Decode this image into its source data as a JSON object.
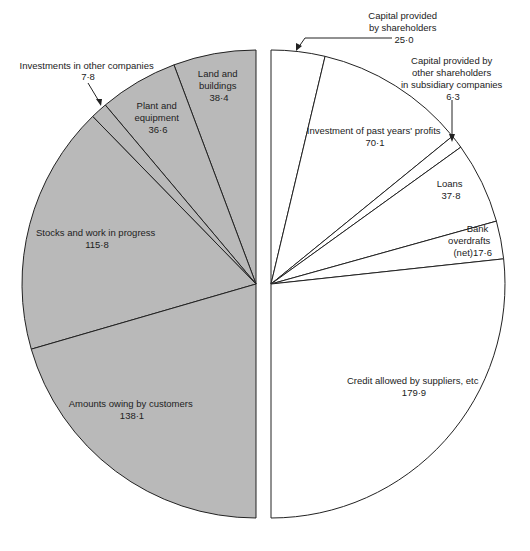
{
  "chart_data": {
    "type": "pie",
    "title": "",
    "layout": "split half-pies: assets (left, shaded) vs sources of funds (right, white)",
    "series": [
      {
        "name": "Assets",
        "side": "left",
        "fill": "#b9b9b9",
        "slices": [
          {
            "label": "Land and buildings",
            "value": 38.4,
            "display": "38·4"
          },
          {
            "label": "Plant and equipment",
            "value": 36.6,
            "display": "36·6"
          },
          {
            "label": "Investments in other companies",
            "value": 7.8,
            "display": "7·8"
          },
          {
            "label": "Stocks and work in progress",
            "value": 115.8,
            "display": "115·8"
          },
          {
            "label": "Amounts owing by customers",
            "value": 138.1,
            "display": "138·1"
          }
        ]
      },
      {
        "name": "Sources of funds",
        "side": "right",
        "fill": "#ffffff",
        "slices": [
          {
            "label": "Capital provided by shareholders",
            "value": 25.0,
            "display": "25·0"
          },
          {
            "label": "Investment of past years' profits",
            "value": 70.1,
            "display": "70·1"
          },
          {
            "label": "Capital provided by other shareholders in subsidiary companies",
            "value": 6.3,
            "display": "6·3"
          },
          {
            "label": "Loans",
            "value": 37.8,
            "display": "37·8"
          },
          {
            "label": "Bank overdrafts (net)",
            "value": 17.6,
            "display": "17·6"
          },
          {
            "label": "Credit allowed by suppliers, etc",
            "value": 179.9,
            "display": "179·9"
          }
        ]
      }
    ],
    "total_each_side": 336.7
  },
  "labels": {
    "land": [
      "Land and",
      "buildings",
      "38·4"
    ],
    "plant": [
      "Plant and",
      "equipment",
      "36·6"
    ],
    "invest": [
      "Investments in other companies",
      "7·8"
    ],
    "stocks": [
      "Stocks and work in progress",
      "115·8"
    ],
    "owing": [
      "Amounts owing by customers",
      "138·1"
    ],
    "capital": [
      "Capital provided",
      "by shareholders",
      "25·0"
    ],
    "profits": [
      "Investment of past years' profits",
      "70·1"
    ],
    "subsid": [
      "Capital provided by",
      "other shareholders",
      "in subsidiary companies",
      "6·3"
    ],
    "loans": [
      "Loans",
      "37·8"
    ],
    "bank": [
      "Bank",
      "overdrafts",
      "(net)17·6"
    ],
    "credit": [
      "Credit allowed by suppliers, etc",
      "179·9"
    ]
  },
  "colors": {
    "asset_fill": "#b9b9b9",
    "liability_fill": "#ffffff",
    "stroke": "#222222"
  }
}
